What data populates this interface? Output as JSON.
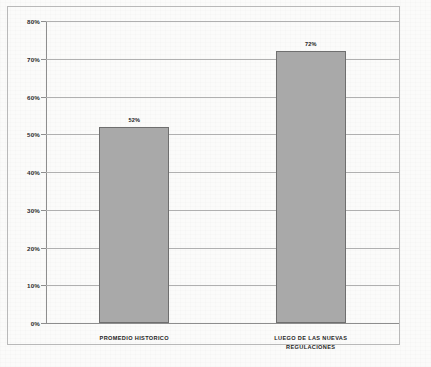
{
  "chart_data": {
    "type": "bar",
    "title": "",
    "xlabel": "",
    "ylabel": "",
    "categories": [
      "PROMEDIO HISTORICO",
      "LUEGO DE LAS NUEVAS\nREGULACIONES"
    ],
    "values": [
      52,
      72
    ],
    "value_labels": [
      "52%",
      "72%"
    ],
    "ylim": [
      0,
      80
    ],
    "ytick_labels": [
      "0%",
      "10%",
      "20%",
      "30%",
      "40%",
      "50%",
      "60%",
      "70%",
      "80%"
    ],
    "ytick_values": [
      0,
      10,
      20,
      30,
      40,
      50,
      60,
      70,
      80
    ],
    "grid": true,
    "legend": false,
    "bar_color": "#a9a9a9",
    "bar_border_color": "#6f6f6f",
    "gridline_color": "#b0b0b0",
    "axis_color": "#8e8e8e",
    "background_color": "#fbfbfa",
    "frame_color": "#b9b9b9"
  }
}
